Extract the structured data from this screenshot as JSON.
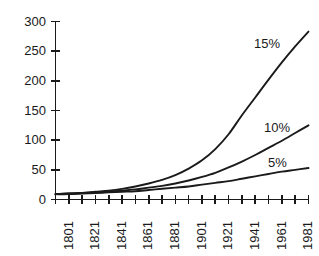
{
  "chart_data": {
    "type": "line",
    "title": "",
    "subtitle": "",
    "xlabel": "",
    "ylabel": "",
    "xlim": [
      1801,
      1991
    ],
    "ylim": [
      0,
      300
    ],
    "grid": false,
    "legend_position": "inline-right-of-curves",
    "y_ticks": [
      0,
      50,
      100,
      150,
      200,
      250,
      300
    ],
    "y_tick_labels": [
      "0",
      "50",
      "100",
      "150",
      "200",
      "250",
      "300"
    ],
    "x_ticks": [
      1801,
      1811,
      1821,
      1831,
      1841,
      1851,
      1861,
      1871,
      1881,
      1891,
      1901,
      1911,
      1921,
      1931,
      1941,
      1951,
      1961,
      1971,
      1981,
      1991
    ],
    "x_tick_labels": [
      "1801",
      "",
      "1821",
      "",
      "1841",
      "",
      "1861",
      "",
      "1881",
      "",
      "1901",
      "",
      "1921",
      "",
      "1941",
      "",
      "1961",
      "",
      "1981",
      ""
    ],
    "x_labeled_ticks": [
      1801,
      1821,
      1841,
      1861,
      1881,
      1901,
      1921,
      1941,
      1961,
      1981
    ],
    "x": [
      1801,
      1811,
      1821,
      1831,
      1841,
      1851,
      1861,
      1871,
      1881,
      1891,
      1901,
      1911,
      1921,
      1931,
      1941,
      1951,
      1961,
      1971,
      1981,
      1991
    ],
    "series": [
      {
        "name": "15%",
        "label": "15%",
        "color": "#1a1a1a",
        "values": [
          9,
          10,
          11,
          13,
          15,
          18,
          22,
          27,
          33,
          41,
          52,
          66,
          85,
          110,
          142,
          172,
          202,
          231,
          258,
          283
        ]
      },
      {
        "name": "10%",
        "label": "10%",
        "color": "#1a1a1a",
        "values": [
          9,
          10,
          11,
          12,
          13,
          15,
          17,
          20,
          23,
          27,
          32,
          38,
          45,
          54,
          64,
          75,
          87,
          99,
          112,
          125
        ]
      },
      {
        "name": "5%",
        "label": "5%",
        "color": "#1a1a1a",
        "values": [
          9,
          9,
          10,
          11,
          12,
          13,
          14,
          16,
          18,
          20,
          22,
          25,
          28,
          31,
          35,
          39,
          43,
          47,
          50,
          53
        ]
      }
    ]
  },
  "axes": {
    "y_axis_name": "value-axis",
    "x_axis_name": "year-axis"
  }
}
